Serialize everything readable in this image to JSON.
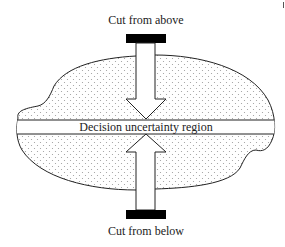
{
  "diagram": {
    "top_label": "Cut from above",
    "center_label": "Decision uncertainty region",
    "bottom_label": "Cut from below",
    "colors": {
      "stroke": "#222222",
      "fill": "#ffffff",
      "dot": "#9a9a9a",
      "bar": "#000000"
    }
  }
}
